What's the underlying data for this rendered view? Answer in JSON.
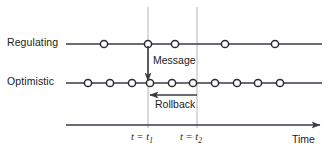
{
  "diagram": {
    "rows": [
      {
        "id": "regulating",
        "label": "Regulating",
        "line_y": 44,
        "line_x_start": 66,
        "line_x_end": 322,
        "event_x": [
          104,
          148,
          175,
          225,
          275
        ]
      },
      {
        "id": "optimistic",
        "label": "Optimistic",
        "line_y": 83,
        "line_x_start": 66,
        "line_x_end": 322,
        "event_x": [
          88,
          110,
          132,
          150,
          172,
          193,
          215,
          237,
          258,
          280
        ]
      }
    ],
    "markers": [
      {
        "id": "t1",
        "label": "t = t",
        "sub": "1",
        "x": 148,
        "y_top": 7,
        "y_bottom": 128
      },
      {
        "id": "t2",
        "label": "t = t",
        "sub": "2",
        "x": 197,
        "y_top": 7,
        "y_bottom": 128
      }
    ],
    "annotations": {
      "message": {
        "label": "Message",
        "arrow_x": 148,
        "arrow_y_start": 46,
        "arrow_y_end": 81
      },
      "rollback": {
        "label": "Rollback",
        "arrow_x_start": 197,
        "arrow_x_end": 150,
        "arrow_y": 95
      }
    },
    "axis": {
      "label": "Time",
      "y": 125,
      "x_start": 66,
      "x_end": 322
    },
    "colors": {
      "line": "#3a3a44",
      "marker_stroke": "#2b2b33",
      "marker_fill": "#ffffff",
      "guide_line": "#b3b3bb",
      "text": "#1a1a1a",
      "background": "#ffffff"
    },
    "style": {
      "circle_radius": 3.6,
      "circle_stroke_width": 1.5,
      "line_width": 1.6,
      "guide_width": 1.0
    }
  }
}
